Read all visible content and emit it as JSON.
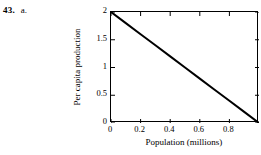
{
  "exercise": {
    "number": "43.",
    "part": "a."
  },
  "chart_data": {
    "type": "line",
    "title": "",
    "xlabel": "Population (millions)",
    "ylabel": "Per capita production",
    "xlim": [
      0,
      1.0
    ],
    "ylim": [
      0,
      2
    ],
    "xticks": [
      0,
      0.2,
      0.4,
      0.6,
      0.8
    ],
    "xtick_labels": [
      "0",
      "0.2",
      "0.4",
      "0.6",
      "0.8"
    ],
    "yticks": [
      0,
      0.5,
      1,
      1.5,
      2
    ],
    "ytick_labels": [
      "0",
      "0.5",
      "1",
      "1.5",
      "2"
    ],
    "grid": false,
    "legend": null,
    "tick_direction": "in",
    "frame": "box",
    "series": [
      {
        "name": "Per capita production",
        "color": "#000000",
        "line_width": 2,
        "x": [
          0,
          0.1,
          0.2,
          0.3,
          0.4,
          0.5,
          0.6,
          0.7,
          0.8,
          0.9,
          1.0
        ],
        "values": [
          2,
          1.8,
          1.6,
          1.4,
          1.2,
          1.0,
          0.8,
          0.6,
          0.4,
          0.2,
          0
        ]
      }
    ]
  },
  "colors": {
    "line": "#000000",
    "axis": "#000000",
    "background": "#ffffff"
  }
}
